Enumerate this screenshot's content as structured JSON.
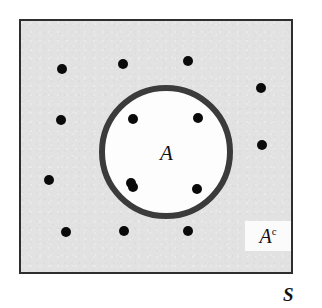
{
  "figure": {
    "type": "set-diagram",
    "width": 322,
    "height": 308,
    "page_background": "#ffffff"
  },
  "sample_space": {
    "label": "S",
    "name": "sample-space",
    "fill_color": "#e2e2e2",
    "border_color": "#2e2e2e",
    "rect": {
      "x": 19,
      "y": 19,
      "width": 274,
      "height": 255
    },
    "label_position": {
      "x": 283,
      "y": 285
    }
  },
  "event_circle": {
    "label": "A",
    "name": "event-a",
    "fill_color": "#fdfdfd",
    "stroke_color": "#3b3b3b",
    "stroke_width": 6,
    "center": {
      "x": 166,
      "y": 152
    },
    "radius": 67,
    "label_position": {
      "x": 160,
      "y": 143
    }
  },
  "complement_label": {
    "base": "A",
    "superscript": "c",
    "full": "Ac",
    "box_fill": "#fbfbfb",
    "box": {
      "x": 245,
      "y": 221,
      "width": 46,
      "height": 30
    }
  },
  "dots": {
    "color": "#0a0a0a",
    "diameter": 10,
    "inside_count": 4,
    "outside_count": 8,
    "total_count": 12,
    "inside": [
      {
        "id": "inside-dot-1",
        "x": 133,
        "y": 119
      },
      {
        "id": "inside-dot-2",
        "x": 198,
        "y": 118
      },
      {
        "id": "inside-dot-3",
        "x": 133,
        "y": 187
      },
      {
        "id": "inside-dot-4",
        "x": 197,
        "y": 189
      }
    ],
    "outside": [
      {
        "id": "outside-dot-1",
        "x": 62,
        "y": 69
      },
      {
        "id": "outside-dot-2",
        "x": 123,
        "y": 64
      },
      {
        "id": "outside-dot-3",
        "x": 188,
        "y": 61
      },
      {
        "id": "outside-dot-4",
        "x": 261,
        "y": 88
      },
      {
        "id": "outside-dot-5",
        "x": 61,
        "y": 120
      },
      {
        "id": "outside-dot-6",
        "x": 262,
        "y": 145
      },
      {
        "id": "outside-dot-7",
        "x": 49,
        "y": 180
      },
      {
        "id": "outside-dot-8",
        "x": 131,
        "y": 183
      },
      {
        "id": "outside-dot-9",
        "x": 66,
        "y": 232
      },
      {
        "id": "outside-dot-10",
        "x": 124,
        "y": 231
      },
      {
        "id": "outside-dot-11",
        "x": 188,
        "y": 231
      }
    ]
  }
}
